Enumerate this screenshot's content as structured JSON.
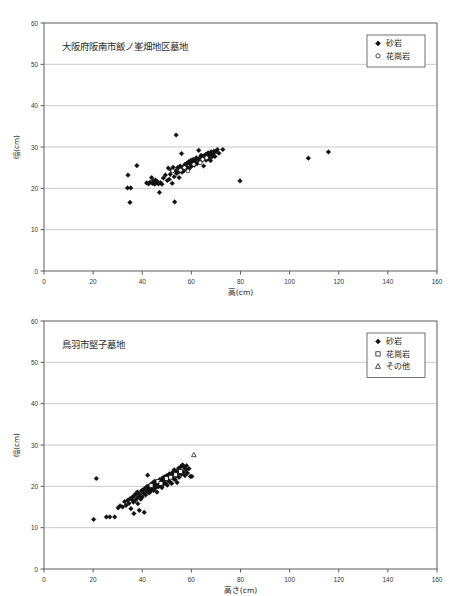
{
  "figure": {
    "kind": "two-panel-scatter",
    "background": "#ffffff",
    "axis_color": "#4d4d4d",
    "grid_color": "#b3b3b3",
    "marker_color": "#111111"
  },
  "chart_data": [
    {
      "id": "chart-top",
      "type": "scatter",
      "title": "大阪府阪南市飯ノ峯畑地区墓地",
      "xlabel": "高(cm)",
      "ylabel": "幅(cm)",
      "xlim": [
        0,
        160
      ],
      "ylim": [
        0,
        60
      ],
      "xticks": [
        0,
        20,
        40,
        60,
        80,
        100,
        120,
        140,
        160
      ],
      "yticks": [
        0,
        10,
        20,
        30,
        40,
        50,
        60
      ],
      "grid": "horizontal",
      "legend_position": "top-right",
      "legend": [
        {
          "label": "砂岩",
          "marker": "diamond",
          "filled": true
        },
        {
          "label": "花崗岩",
          "marker": "circle",
          "filled": false
        }
      ],
      "series": [
        {
          "name": "砂岩",
          "marker": "diamond",
          "filled": true,
          "points": [
            [
              34.2,
              23.2
            ],
            [
              34.0,
              20.1
            ],
            [
              35.3,
              20.1
            ],
            [
              35.0,
              16.6
            ],
            [
              37.8,
              25.5
            ],
            [
              41.8,
              21.3
            ],
            [
              42.6,
              21.1
            ],
            [
              43.2,
              21.5
            ],
            [
              43.8,
              22.6
            ],
            [
              44.1,
              21.2
            ],
            [
              44.6,
              21.9
            ],
            [
              45.0,
              21.0
            ],
            [
              45.4,
              22.0
            ],
            [
              45.8,
              21.3
            ],
            [
              46.2,
              21.6
            ],
            [
              46.6,
              21.1
            ],
            [
              47.0,
              19.0
            ],
            [
              47.4,
              21.4
            ],
            [
              48.0,
              21.0
            ],
            [
              48.6,
              22.5
            ],
            [
              49.4,
              23.2
            ],
            [
              50.2,
              21.9
            ],
            [
              50.6,
              24.9
            ],
            [
              51.0,
              22.2
            ],
            [
              51.4,
              23.4
            ],
            [
              51.8,
              24.4
            ],
            [
              52.2,
              21.2
            ],
            [
              52.6,
              25.1
            ],
            [
              53.0,
              22.8
            ],
            [
              53.2,
              16.7
            ],
            [
              53.6,
              24.2
            ],
            [
              53.8,
              32.9
            ],
            [
              54.0,
              23.6
            ],
            [
              54.4,
              25.0
            ],
            [
              54.8,
              24.0
            ],
            [
              55.0,
              22.6
            ],
            [
              55.4,
              25.4
            ],
            [
              55.8,
              24.6
            ],
            [
              56.0,
              28.4
            ],
            [
              56.2,
              23.9
            ],
            [
              56.6,
              25.2
            ],
            [
              57.0,
              24.3
            ],
            [
              57.4,
              25.8
            ],
            [
              57.8,
              24.8
            ],
            [
              58.0,
              26.0
            ],
            [
              58.4,
              25.1
            ],
            [
              58.8,
              26.4
            ],
            [
              59.0,
              24.7
            ],
            [
              59.4,
              25.9
            ],
            [
              59.8,
              26.8
            ],
            [
              60.0,
              25.3
            ],
            [
              60.4,
              26.2
            ],
            [
              60.8,
              27.0
            ],
            [
              61.2,
              25.6
            ],
            [
              61.6,
              26.6
            ],
            [
              62.0,
              27.4
            ],
            [
              62.4,
              26.0
            ],
            [
              62.8,
              27.1
            ],
            [
              63.0,
              29.2
            ],
            [
              63.4,
              26.5
            ],
            [
              63.8,
              27.6
            ],
            [
              64.0,
              28.0
            ],
            [
              64.4,
              26.9
            ],
            [
              64.8,
              27.8
            ],
            [
              65.0,
              25.4
            ],
            [
              65.4,
              27.2
            ],
            [
              65.8,
              28.2
            ],
            [
              66.0,
              26.8
            ],
            [
              66.4,
              27.9
            ],
            [
              66.8,
              28.6
            ],
            [
              67.0,
              27.3
            ],
            [
              67.4,
              28.1
            ],
            [
              67.8,
              26.7
            ],
            [
              68.0,
              28.8
            ],
            [
              68.4,
              27.6
            ],
            [
              68.8,
              28.3
            ],
            [
              69.2,
              29.0
            ],
            [
              69.6,
              27.7
            ],
            [
              70.0,
              28.9
            ],
            [
              70.6,
              29.4
            ],
            [
              71.2,
              28.5
            ],
            [
              72.8,
              29.4
            ],
            [
              79.8,
              21.8
            ],
            [
              107.6,
              27.3
            ],
            [
              115.8,
              28.8
            ]
          ]
        },
        {
          "name": "花崗岩",
          "marker": "circle",
          "filled": false,
          "points": [
            [
              52.4,
              24.2
            ],
            [
              55.6,
              24.4
            ],
            [
              57.2,
              25.0
            ],
            [
              58.6,
              24.2
            ],
            [
              61.0,
              25.8
            ],
            [
              63.6,
              26.2
            ],
            [
              64.6,
              27.0
            ],
            [
              66.2,
              27.4
            ]
          ]
        }
      ]
    },
    {
      "id": "chart-bottom",
      "type": "scatter",
      "title": "鳥羽市堅子墓地",
      "xlabel": "高さ(cm)",
      "ylabel": "幅(cm)",
      "xlim": [
        0,
        160
      ],
      "ylim": [
        0,
        60
      ],
      "xticks": [
        0,
        20,
        40,
        60,
        80,
        100,
        120,
        140,
        160
      ],
      "yticks": [
        0,
        10,
        20,
        30,
        40,
        50,
        60
      ],
      "grid": "horizontal",
      "legend_position": "top-right",
      "legend": [
        {
          "label": "砂岩",
          "marker": "diamond",
          "filled": true
        },
        {
          "label": "花崗岩",
          "marker": "square",
          "filled": false
        },
        {
          "label": "その他",
          "marker": "triangle",
          "filled": false
        }
      ],
      "series": [
        {
          "name": "砂岩",
          "marker": "diamond",
          "filled": true,
          "points": [
            [
              20.2,
              12.0
            ],
            [
              21.3,
              21.9
            ],
            [
              25.4,
              12.6
            ],
            [
              26.8,
              12.6
            ],
            [
              28.8,
              12.6
            ],
            [
              30.2,
              14.8
            ],
            [
              31.0,
              15.3
            ],
            [
              32.0,
              15.0
            ],
            [
              32.8,
              16.3
            ],
            [
              33.4,
              15.4
            ],
            [
              34.0,
              16.6
            ],
            [
              34.6,
              15.9
            ],
            [
              35.0,
              17.0
            ],
            [
              35.4,
              14.6
            ],
            [
              35.8,
              16.8
            ],
            [
              36.0,
              17.4
            ],
            [
              36.4,
              16.2
            ],
            [
              36.6,
              13.4
            ],
            [
              36.8,
              17.8
            ],
            [
              37.2,
              16.6
            ],
            [
              37.4,
              18.2
            ],
            [
              37.8,
              17.1
            ],
            [
              38.0,
              18.6
            ],
            [
              38.2,
              15.8
            ],
            [
              38.6,
              17.6
            ],
            [
              38.8,
              14.2
            ],
            [
              39.0,
              18.0
            ],
            [
              39.4,
              16.9
            ],
            [
              39.6,
              18.9
            ],
            [
              40.0,
              17.4
            ],
            [
              40.2,
              19.1
            ],
            [
              40.6,
              18.3
            ],
            [
              40.8,
              13.7
            ],
            [
              41.0,
              19.5
            ],
            [
              41.4,
              17.9
            ],
            [
              41.8,
              18.8
            ],
            [
              42.0,
              20.0
            ],
            [
              42.2,
              22.7
            ],
            [
              42.4,
              19.2
            ],
            [
              42.8,
              18.4
            ],
            [
              43.0,
              19.8
            ],
            [
              43.4,
              20.4
            ],
            [
              43.6,
              18.9
            ],
            [
              44.0,
              19.4
            ],
            [
              44.2,
              20.8
            ],
            [
              44.6,
              19.0
            ],
            [
              44.8,
              20.2
            ],
            [
              45.0,
              21.2
            ],
            [
              45.4,
              19.6
            ],
            [
              45.8,
              20.6
            ],
            [
              46.0,
              18.6
            ],
            [
              46.2,
              21.0
            ],
            [
              46.6,
              19.9
            ],
            [
              46.8,
              20.9
            ],
            [
              47.0,
              21.6
            ],
            [
              47.4,
              20.1
            ],
            [
              47.8,
              21.3
            ],
            [
              48.0,
              19.7
            ],
            [
              48.2,
              22.0
            ],
            [
              48.6,
              20.5
            ],
            [
              48.8,
              21.5
            ],
            [
              49.0,
              22.3
            ],
            [
              49.4,
              20.8
            ],
            [
              49.6,
              21.8
            ],
            [
              50.0,
              22.6
            ],
            [
              50.2,
              20.3
            ],
            [
              50.6,
              21.4
            ],
            [
              50.8,
              22.1
            ],
            [
              51.0,
              23.0
            ],
            [
              51.4,
              21.0
            ],
            [
              51.8,
              22.4
            ],
            [
              52.0,
              20.7
            ],
            [
              52.2,
              23.3
            ],
            [
              52.6,
              21.9
            ],
            [
              52.8,
              22.8
            ],
            [
              53.0,
              24.0
            ],
            [
              53.4,
              21.6
            ],
            [
              53.8,
              22.5
            ],
            [
              54.0,
              23.6
            ],
            [
              54.2,
              20.9
            ],
            [
              54.6,
              23.1
            ],
            [
              54.8,
              24.4
            ],
            [
              55.0,
              22.2
            ],
            [
              55.4,
              23.8
            ],
            [
              55.8,
              24.8
            ],
            [
              56.0,
              22.9
            ],
            [
              56.4,
              25.2
            ],
            [
              56.8,
              23.4
            ],
            [
              57.0,
              24.6
            ],
            [
              57.4,
              22.6
            ],
            [
              57.8,
              24.0
            ],
            [
              58.0,
              25.0
            ],
            [
              58.4,
              23.2
            ],
            [
              59.0,
              24.3
            ],
            [
              59.6,
              22.4
            ],
            [
              60.2,
              22.4
            ]
          ]
        },
        {
          "name": "花崗岩",
          "marker": "square",
          "filled": false,
          "points": [
            [
              43.6,
              20.2
            ],
            [
              46.4,
              21.2
            ],
            [
              47.6,
              20.7
            ],
            [
              49.8,
              21.9
            ],
            [
              51.6,
              22.2
            ],
            [
              53.6,
              22.8
            ],
            [
              55.6,
              23.6
            ]
          ]
        },
        {
          "name": "その他",
          "marker": "triangle",
          "filled": false,
          "points": [
            [
              61.0,
              27.6
            ]
          ]
        }
      ]
    }
  ]
}
